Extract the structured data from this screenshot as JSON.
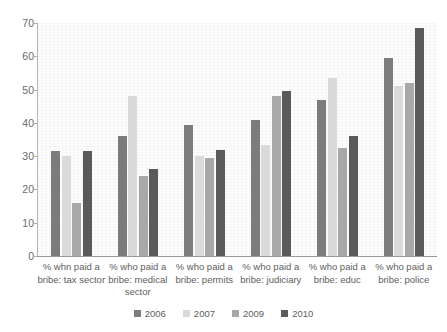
{
  "chart_data": {
    "type": "bar",
    "title": "",
    "subtitle": "",
    "xlabel": "",
    "ylabel": "",
    "ylim": [
      0,
      70
    ],
    "yticks": [
      0,
      10,
      20,
      30,
      40,
      50,
      60,
      70
    ],
    "ytick_labels": [
      "0",
      "10",
      "20",
      "30",
      "40",
      "50",
      "60",
      "70"
    ],
    "grid": false,
    "legend_position": "bottom",
    "categories": [
      "% whn paid a bribe: tax sector",
      "% who paid a bribe: medical sector",
      "% who paid a bribe: permits",
      "% who paid a bribe: judiciary",
      "% who paid a bribe: educ",
      "% who paid a bribe: police"
    ],
    "category_lines": [
      [
        "% whn paid a",
        "bribe: tax sector"
      ],
      [
        "% who paid a",
        "bribe: medical",
        "sector"
      ],
      [
        "% who paid a",
        "bribe: permits"
      ],
      [
        "% who paid a",
        "bribe: judiciary"
      ],
      [
        "% who paid a",
        "bribe: educ"
      ],
      [
        "% who paid a",
        "bribe: police"
      ]
    ],
    "series": [
      {
        "name": "2006",
        "color": "#7c7c7c",
        "values": [
          31.5,
          36.0,
          39.5,
          41.0,
          47.0,
          59.5
        ]
      },
      {
        "name": "2007",
        "color": "#dadada",
        "values": [
          30.0,
          48.0,
          30.0,
          33.5,
          53.5,
          51.0
        ]
      },
      {
        "name": "2009",
        "color": "#a8a8a8",
        "values": [
          16.0,
          24.0,
          29.5,
          48.0,
          32.5,
          52.0
        ]
      },
      {
        "name": "2010",
        "color": "#5a5a5a",
        "values": [
          31.5,
          26.0,
          32.0,
          49.5,
          36.0,
          68.5
        ]
      }
    ]
  },
  "legend": {
    "items": [
      {
        "label": "2006",
        "color": "#7c7c7c"
      },
      {
        "label": "2007",
        "color": "#dadada"
      },
      {
        "label": "2009",
        "color": "#a8a8a8"
      },
      {
        "label": "2010",
        "color": "#5a5a5a"
      }
    ]
  }
}
